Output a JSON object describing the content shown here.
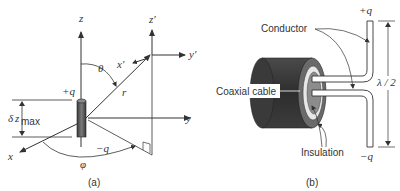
{
  "panel_a": {
    "caption": "(a)",
    "axes": {
      "z": "z",
      "y": "y",
      "x": "x",
      "z_prime": "z′",
      "y_prime": "y′",
      "x_prime": "x′"
    },
    "labels": {
      "plus_q": "+q",
      "minus_q": "−q",
      "theta": "θ",
      "phi": "φ",
      "r": "r",
      "delta": "δ",
      "z": "z",
      "max": "max"
    }
  },
  "panel_b": {
    "caption": "(b)",
    "labels": {
      "conductor": "Conductor",
      "coaxial_cable": "Coaxial cable",
      "insulation": "Insulation",
      "plus_q": "+q",
      "minus_q": "−q",
      "half_wavelength": "λ / 2"
    }
  },
  "colors": {
    "line": "#333333",
    "cable_dark": "#3a3a3a",
    "cable_mid": "#5a5a5a",
    "dipole_body": "#555555",
    "insulation": "#888888"
  }
}
